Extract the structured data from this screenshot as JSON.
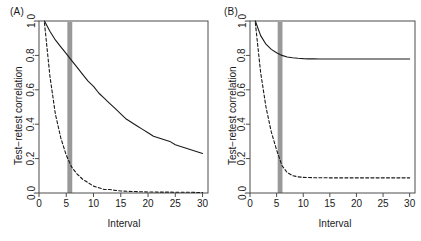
{
  "figure": {
    "panels": [
      {
        "label": "(A)",
        "xlabel": "Interval",
        "ylabel": "Test−retest correlation"
      },
      {
        "label": "(B)",
        "xlabel": "Interval",
        "ylabel": "Test−retest correlation"
      }
    ]
  },
  "chart_data": [
    {
      "type": "line",
      "panel": "(A)",
      "title": "",
      "xlabel": "Interval",
      "ylabel": "Test−retest correlation",
      "xlim": [
        0,
        31
      ],
      "ylim": [
        0.0,
        1.0
      ],
      "xticks": [
        0,
        5,
        10,
        15,
        20,
        25,
        30
      ],
      "xtick_labels": [
        "0",
        "5",
        "10",
        "15",
        "20",
        "25",
        "30"
      ],
      "yticks": [
        0.0,
        0.2,
        0.4,
        0.6,
        0.8,
        1.0
      ],
      "ytick_labels": [
        "0.0",
        "0.2",
        "0.4",
        "0.6",
        "0.8",
        "1.0"
      ],
      "grid": false,
      "legend": false,
      "annotations": [
        {
          "kind": "vertical-band",
          "name": "grey-interval-band",
          "x_start": 5.2,
          "x_end": 6.1,
          "color": "#999999"
        }
      ],
      "x": [
        1,
        2,
        3,
        4,
        5,
        6,
        7,
        8,
        9,
        10,
        11,
        12,
        13,
        14,
        15,
        16,
        17,
        18,
        19,
        20,
        21,
        22,
        23,
        24,
        25,
        26,
        27,
        28,
        29,
        30
      ],
      "series": [
        {
          "name": "solid-curve",
          "style": "solid",
          "color": "#1a1a1a",
          "values": [
            1.0,
            0.94,
            0.89,
            0.85,
            0.81,
            0.77,
            0.73,
            0.69,
            0.65,
            0.62,
            0.58,
            0.55,
            0.52,
            0.49,
            0.46,
            0.43,
            0.41,
            0.39,
            0.37,
            0.35,
            0.33,
            0.32,
            0.31,
            0.3,
            0.28,
            0.27,
            0.26,
            0.25,
            0.24,
            0.23
          ]
        },
        {
          "name": "dashed-curve",
          "style": "dashed",
          "color": "#1a1a1a",
          "values": [
            0.99,
            0.68,
            0.46,
            0.32,
            0.22,
            0.15,
            0.11,
            0.08,
            0.06,
            0.04,
            0.03,
            0.02,
            0.02,
            0.015,
            0.012,
            0.01,
            0.009,
            0.008,
            0.007,
            0.006,
            0.006,
            0.005,
            0.005,
            0.005,
            0.004,
            0.004,
            0.004,
            0.004,
            0.003,
            0.003
          ]
        }
      ]
    },
    {
      "type": "line",
      "panel": "(B)",
      "title": "",
      "xlabel": "Interval",
      "ylabel": "Test−retest correlation",
      "xlim": [
        0,
        31
      ],
      "ylim": [
        0.0,
        1.0
      ],
      "xticks": [
        0,
        5,
        10,
        15,
        20,
        25,
        30
      ],
      "xtick_labels": [
        "0",
        "5",
        "10",
        "15",
        "20",
        "25",
        "30"
      ],
      "yticks": [
        0.0,
        0.2,
        0.4,
        0.6,
        0.8,
        1.0
      ],
      "ytick_labels": [
        "0.0",
        "0.2",
        "0.4",
        "0.6",
        "0.8",
        "1.0"
      ],
      "grid": false,
      "legend": false,
      "annotations": [
        {
          "kind": "vertical-band",
          "name": "grey-interval-band",
          "x_start": 5.2,
          "x_end": 6.1,
          "color": "#999999"
        }
      ],
      "x": [
        1,
        2,
        3,
        4,
        5,
        6,
        7,
        8,
        9,
        10,
        11,
        12,
        13,
        14,
        15,
        16,
        17,
        18,
        19,
        20,
        21,
        22,
        23,
        24,
        25,
        26,
        27,
        28,
        29,
        30
      ],
      "series": [
        {
          "name": "solid-curve",
          "style": "solid",
          "color": "#1a1a1a",
          "values": [
            1.0,
            0.915,
            0.865,
            0.835,
            0.815,
            0.8,
            0.791,
            0.786,
            0.783,
            0.781,
            0.78,
            0.78,
            0.779,
            0.779,
            0.779,
            0.779,
            0.779,
            0.779,
            0.779,
            0.779,
            0.779,
            0.779,
            0.779,
            0.779,
            0.779,
            0.779,
            0.779,
            0.779,
            0.779,
            0.779
          ]
        },
        {
          "name": "dashed-curve",
          "style": "dashed",
          "color": "#1a1a1a",
          "values": [
            0.99,
            0.7,
            0.5,
            0.355,
            0.25,
            0.16,
            0.118,
            0.101,
            0.094,
            0.091,
            0.09,
            0.089,
            0.089,
            0.089,
            0.088,
            0.088,
            0.088,
            0.088,
            0.088,
            0.088,
            0.088,
            0.088,
            0.088,
            0.088,
            0.088,
            0.088,
            0.088,
            0.088,
            0.088,
            0.088
          ]
        }
      ]
    }
  ]
}
